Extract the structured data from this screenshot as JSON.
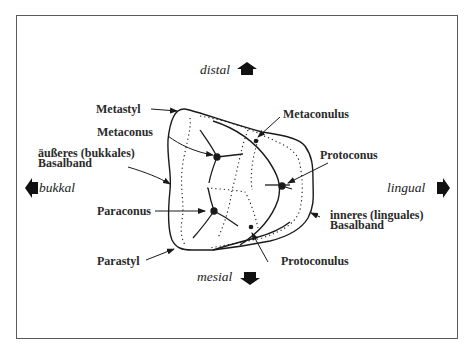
{
  "directions": {
    "distal": "distal",
    "mesial": "mesial",
    "bukkal": "bukkal",
    "lingual": "lingual"
  },
  "labels": {
    "metastyl": "Metastyl",
    "metaconus": "Metaconus",
    "aeusseres_line1": "äußeres (bukkales)",
    "aeusseres_line2": "Basalband",
    "paraconus": "Paraconus",
    "parastyl": "Parastyl",
    "metaconulus": "Metaconulus",
    "protoconus": "Protoconus",
    "inneres_line1": "inneres (linguales)",
    "inneres_line2": "Basalband",
    "protoconulus": "Protoconulus"
  },
  "icons": {
    "distal_arrow": "arrow-up-icon",
    "mesial_arrow": "arrow-down-icon",
    "bukkal_arrow": "arrow-left-icon",
    "lingual_arrow": "arrow-right-icon"
  },
  "colors": {
    "ink": "#1a1a1a",
    "frame": "#5a5a5a",
    "background": "#ffffff"
  }
}
